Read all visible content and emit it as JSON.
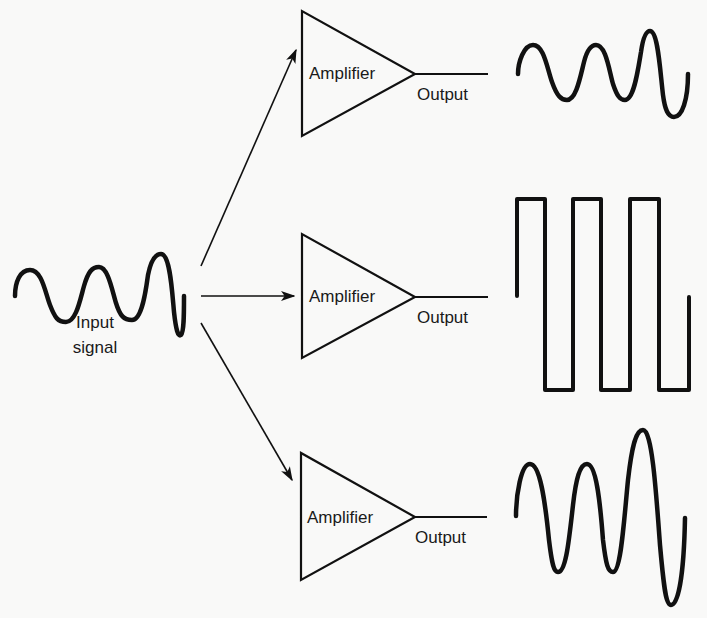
{
  "diagram": {
    "background": "#f9f9f8",
    "stroke_color": "#111111",
    "input": {
      "label_line1": "Input",
      "label_line2": "signal",
      "waveform": "sine with growing third peak"
    },
    "amplifiers": [
      {
        "label": "Amplifier",
        "output_label": "Output",
        "output_waveform": "sine (faithful copy of input)"
      },
      {
        "label": "Amplifier",
        "output_label": "Output",
        "output_waveform": "square wave (distorted)"
      },
      {
        "label": "Amplifier",
        "output_label": "Output",
        "output_waveform": "amplified sine (larger amplitude)"
      }
    ],
    "arrows": [
      {
        "from": "input",
        "to": "amplifier-1"
      },
      {
        "from": "input",
        "to": "amplifier-2"
      },
      {
        "from": "input",
        "to": "amplifier-3"
      }
    ]
  }
}
